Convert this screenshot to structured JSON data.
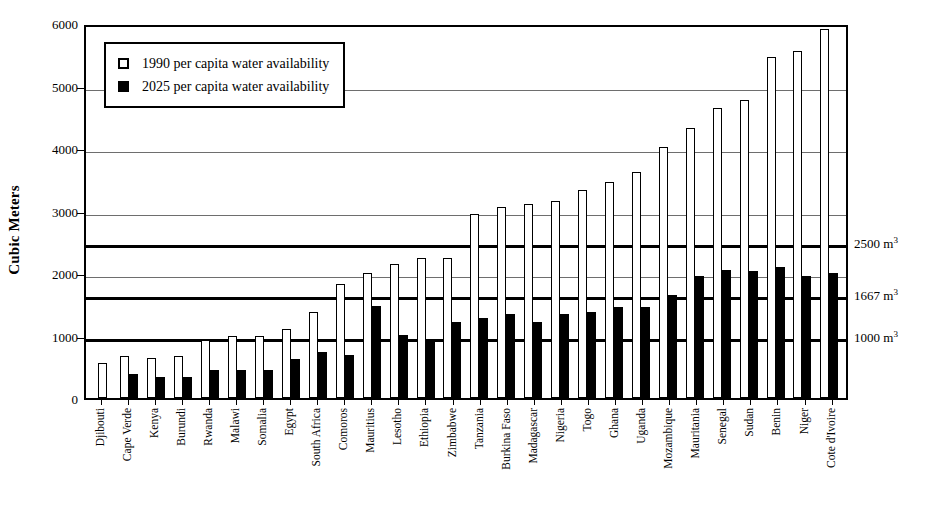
{
  "chart_data": {
    "type": "bar",
    "title": "",
    "xlabel": "",
    "ylabel": "Cubic Meters",
    "ylim": [
      0,
      6000
    ],
    "yticks": [
      0,
      1000,
      2000,
      3000,
      4000,
      5000,
      6000
    ],
    "grid": true,
    "legend_position": "top-left",
    "categories": [
      "Djibouti",
      "Cape Verde",
      "Kenya",
      "Burundi",
      "Rwanda",
      "Malawi",
      "Somalia",
      "Egypt",
      "South Africa",
      "Comoros",
      "Mauritius",
      "Lesotho",
      "Ethiopia",
      "Zimbabwe",
      "Tanzania",
      "Burkina Faso",
      "Madagascar",
      "Nigeria",
      "Togo",
      "Ghana",
      "Uganda",
      "Mozambique",
      "Mauritania",
      "Senegal",
      "Sudan",
      "Benin",
      "Niger",
      "Cote d'Ivoire"
    ],
    "series": [
      {
        "name": "1990 per capita water availability",
        "color": "#ffffff",
        "values": [
          560,
          670,
          640,
          680,
          930,
          1000,
          1000,
          1110,
          1370,
          1830,
          2000,
          2150,
          2240,
          2240,
          2950,
          3060,
          3110,
          3150,
          3330,
          3460,
          3620,
          4010,
          4320,
          4640,
          4770,
          5450,
          5550,
          5900
        ]
      },
      {
        "name": "2025 per capita water availability",
        "color": "#000000",
        "values": [
          0,
          390,
          330,
          330,
          450,
          450,
          450,
          630,
          740,
          690,
          1470,
          1010,
          940,
          1210,
          1280,
          1350,
          1220,
          1350,
          1370,
          1450,
          1450,
          1650,
          1960,
          2050,
          2030,
          2090,
          1960,
          2000
        ]
      }
    ],
    "reference_lines": [
      {
        "value": 2500,
        "label": "2500 m",
        "exponent": "3"
      },
      {
        "value": 1667,
        "label": "1667 m",
        "exponent": "3"
      },
      {
        "value": 1000,
        "label": "1000 m",
        "exponent": "3"
      }
    ]
  },
  "legend": {
    "items": [
      {
        "label": "1990 per capita water availability",
        "style": "open"
      },
      {
        "label": "2025 per capita water availability",
        "style": "filled"
      }
    ]
  }
}
